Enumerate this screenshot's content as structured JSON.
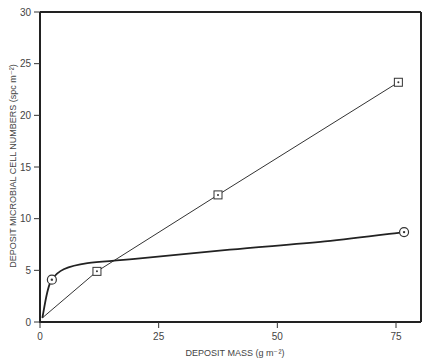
{
  "chart_data": {
    "type": "line",
    "title": "",
    "xlabel": "DEPOSIT MASS (g m⁻²)",
    "ylabel": "DEPOSIT MICROBIAL CELL NUMBERS (spc m⁻²)",
    "xlim": [
      0,
      80
    ],
    "ylim": [
      0,
      30
    ],
    "x_ticks": [
      0,
      25,
      50,
      75
    ],
    "y_ticks": [
      0,
      5,
      10,
      15,
      20,
      25,
      30
    ],
    "grid": false,
    "legend": null,
    "series": [
      {
        "name": "square-marker series",
        "marker": "square",
        "line": "straight",
        "x": [
          0.5,
          12,
          37.5,
          75.5
        ],
        "y": [
          0.4,
          4.9,
          12.3,
          23.2
        ],
        "marker_points": [
          [
            12,
            4.9
          ],
          [
            37.5,
            12.3
          ],
          [
            75.5,
            23.2
          ]
        ]
      },
      {
        "name": "circle-marker series",
        "marker": "circle",
        "line": "smooth curve",
        "x": [
          0.5,
          1.5,
          2.5,
          5,
          10,
          20,
          40,
          60,
          76.7
        ],
        "y": [
          0.4,
          2.8,
          4.1,
          5.1,
          5.7,
          6.1,
          7.0,
          7.8,
          8.7
        ],
        "marker_points": [
          [
            2.5,
            4.1
          ],
          [
            76.7,
            8.7
          ]
        ]
      }
    ]
  }
}
